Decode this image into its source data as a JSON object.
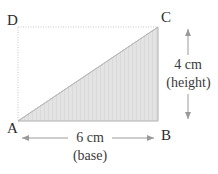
{
  "diagram": {
    "type": "right-triangle-in-rectangle",
    "vertices": {
      "A": {
        "label": "A",
        "position": "bottom-left"
      },
      "B": {
        "label": "B",
        "position": "bottom-right"
      },
      "C": {
        "label": "C",
        "position": "top-right"
      },
      "D": {
        "label": "D",
        "position": "top-left"
      }
    },
    "shaded_region": "triangle ABC",
    "dimensions": {
      "base": {
        "value": "6 cm",
        "caption": "(base)",
        "edge": "AB"
      },
      "height": {
        "value": "4 cm",
        "caption": "(height)",
        "edge": "BC"
      }
    },
    "colors": {
      "shade": "#e2e2e2",
      "outline": "#a8a8a8",
      "dotted": "#c4c4c4",
      "arrow": "#9a9a9a",
      "text": "#2b2b2b"
    }
  }
}
